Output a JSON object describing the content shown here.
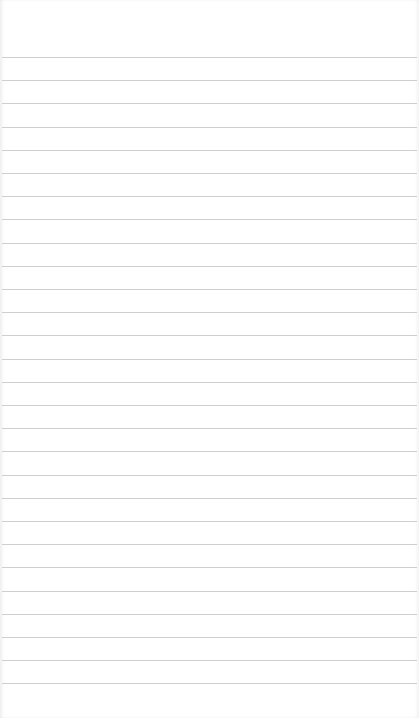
{
  "page": {
    "type": "blank-lined-paper",
    "line_color": "#cfcfcf",
    "background": "#ffffff"
  },
  "lines": {
    "count": 28,
    "first_y": 57,
    "spacing": 23.2
  }
}
